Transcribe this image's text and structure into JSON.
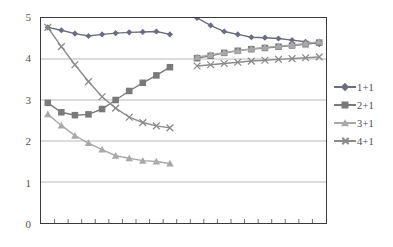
{
  "chart_data": {
    "type": "line",
    "title": "",
    "xlabel": "",
    "ylabel": "",
    "ylim": [
      0,
      5
    ],
    "y_ticks": [
      0,
      1,
      2,
      3,
      4,
      5
    ],
    "grid": "horizontal",
    "legend_position": "right",
    "x_tick_count": 21,
    "x_axis_labels": [],
    "series": [
      {
        "name": "1+1",
        "color": "#6b6b82",
        "marker": "diamond",
        "groups": [
          {
            "x": [
              0.5,
              1.5,
              2.5,
              3.5,
              4.5,
              5.5,
              6.5,
              7.5,
              8.5,
              9.5
            ],
            "values": [
              4.77,
              4.7,
              4.62,
              4.56,
              4.6,
              4.63,
              4.65,
              4.66,
              4.67,
              4.6
            ]
          },
          {
            "x": [
              11.5,
              12.5,
              13.5,
              14.5,
              15.5,
              16.5,
              17.5,
              18.5,
              19.5,
              20.5
            ],
            "values": [
              5.0,
              4.82,
              4.67,
              4.6,
              4.53,
              4.52,
              4.5,
              4.46,
              4.42,
              4.36
            ]
          }
        ]
      },
      {
        "name": "2+1",
        "color": "#7a7a7a",
        "marker": "square",
        "groups": [
          {
            "x": [
              0.5,
              1.5,
              2.5,
              3.5,
              4.5,
              5.5,
              6.5,
              7.5,
              8.5,
              9.5
            ],
            "values": [
              2.93,
              2.7,
              2.63,
              2.65,
              2.78,
              3.0,
              3.22,
              3.42,
              3.6,
              3.8
            ]
          },
          {
            "x": [
              11.5,
              12.5,
              13.5,
              14.5,
              15.5,
              16.5,
              17.5,
              18.5,
              19.5,
              20.5
            ],
            "values": [
              4.02,
              4.08,
              4.15,
              4.2,
              4.24,
              4.27,
              4.3,
              4.33,
              4.36,
              4.4
            ]
          }
        ]
      },
      {
        "name": "3+1",
        "color": "#a9a9a9",
        "marker": "triangle",
        "groups": [
          {
            "x": [
              0.5,
              1.5,
              2.5,
              3.5,
              4.5,
              5.5,
              6.5,
              7.5,
              8.5,
              9.5
            ],
            "values": [
              2.65,
              2.38,
              2.13,
              1.95,
              1.79,
              1.64,
              1.58,
              1.52,
              1.5,
              1.45
            ]
          },
          {
            "x": [
              11.5,
              12.5,
              13.5,
              14.5,
              15.5,
              16.5,
              17.5,
              18.5,
              19.5,
              20.5
            ],
            "values": [
              4.05,
              4.1,
              4.16,
              4.2,
              4.25,
              4.28,
              4.31,
              4.34,
              4.38,
              4.42
            ]
          }
        ]
      },
      {
        "name": "4+1",
        "color": "#8a8a8a",
        "marker": "cross",
        "groups": [
          {
            "x": [
              0.5,
              1.5,
              2.5,
              3.5,
              4.5,
              5.5,
              6.5,
              7.5,
              8.5,
              9.5
            ],
            "values": [
              4.77,
              4.3,
              3.86,
              3.45,
              3.08,
              2.8,
              2.58,
              2.45,
              2.37,
              2.32
            ]
          },
          {
            "x": [
              11.5,
              12.5,
              13.5,
              14.5,
              15.5,
              16.5,
              17.5,
              18.5,
              19.5,
              20.5
            ],
            "values": [
              3.83,
              3.86,
              3.89,
              3.92,
              3.95,
              3.97,
              3.99,
              4.01,
              4.03,
              4.05
            ]
          }
        ]
      }
    ]
  },
  "legend": {
    "items": [
      {
        "label": "1+1"
      },
      {
        "label": "2+1"
      },
      {
        "label": "3+1"
      },
      {
        "label": "4+1"
      }
    ]
  },
  "axis": {
    "y_labels": [
      "5",
      "4",
      "3",
      "2",
      "1",
      "0"
    ]
  },
  "colors": {
    "grid": "#b9b9b9",
    "frame": "#3a3a3a",
    "tick_text": "#55504c"
  }
}
